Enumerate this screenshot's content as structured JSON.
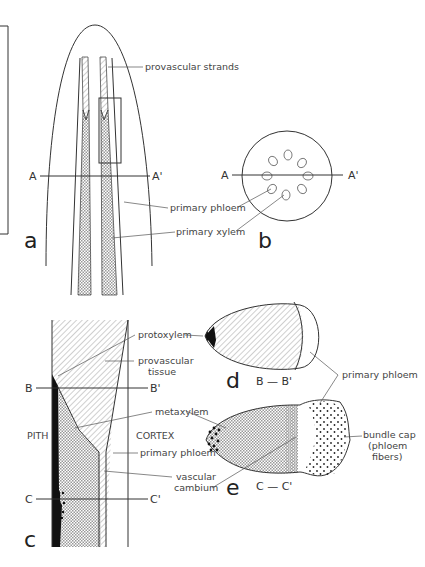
{
  "panels": {
    "a": {
      "letter": "a",
      "labels": {
        "provascular_strands": "provascular strands",
        "primary_phloem": "primary phloem",
        "primary_xylem": "primary xylem"
      },
      "section": {
        "left": "A",
        "right": "A'"
      }
    },
    "b": {
      "letter": "b",
      "section": {
        "left": "A",
        "right": "A'"
      }
    },
    "c": {
      "letter": "c",
      "labels": {
        "protoxylem": "protoxylem",
        "provascular_tissue_1": "provascular",
        "provascular_tissue_2": "tissue",
        "metaxylem": "metaxylem",
        "pith": "PITH",
        "cortex": "CORTEX",
        "primary_phloem": "primary phloem",
        "vascular_cambium_1": "vascular",
        "vascular_cambium_2": "cambium"
      },
      "sections": {
        "b_left": "B",
        "b_right": "B'",
        "c_left": "C",
        "c_right": "C'"
      }
    },
    "d": {
      "letter": "d",
      "section_label": "B — B'"
    },
    "e": {
      "letter": "e",
      "section_label": "C — C'",
      "labels": {
        "primary_phloem": "primary phloem",
        "bundle_cap_1": "bundle cap",
        "bundle_cap_2": "(phloem",
        "bundle_cap_3": "fibers)"
      }
    }
  }
}
